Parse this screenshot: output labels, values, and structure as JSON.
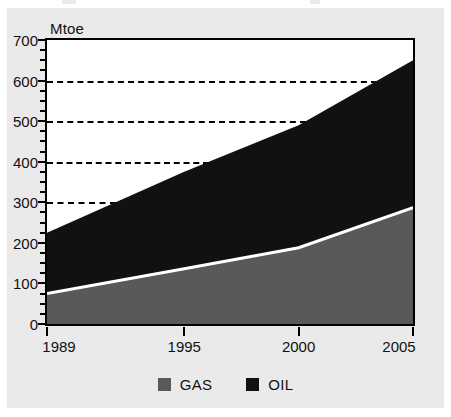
{
  "chart_data": {
    "type": "area",
    "title": "",
    "subtitle": "",
    "stacked": true,
    "xlabel": "",
    "ylabel": "Mtoe",
    "unit_label": "Mtoe",
    "x": [
      1989,
      1995,
      2000,
      2005
    ],
    "xlim": [
      1989,
      2005
    ],
    "ylim": [
      0,
      700
    ],
    "y_ticks": [
      0,
      100,
      200,
      300,
      400,
      500,
      600,
      700
    ],
    "y_tick_labels": [
      "0",
      "100",
      "200",
      "300",
      "400",
      "500",
      "600",
      "700"
    ],
    "y_minor_tick_step": 25,
    "x_ticks": [
      1989,
      1995,
      2000,
      2005
    ],
    "x_tick_labels": [
      "1989",
      "1995",
      "2000",
      "2005"
    ],
    "grid": "horizontal-dashed",
    "gridlines": [
      300,
      400,
      500,
      600
    ],
    "legend_position": "bottom-center",
    "series": [
      {
        "name": "GAS",
        "color": "#595959",
        "values": [
          75,
          136,
          188,
          287
        ]
      },
      {
        "name": "OIL",
        "color": "#111111",
        "values": [
          150,
          239,
          302,
          363
        ]
      }
    ],
    "stack_totals": [
      225,
      375,
      490,
      650
    ],
    "separator_line_color": "#ffffff"
  },
  "legend": {
    "items": [
      {
        "label": "GAS",
        "color": "#595959"
      },
      {
        "label": "OIL",
        "color": "#111111"
      }
    ]
  },
  "axes": {
    "unit_caption": "Mtoe",
    "y_labels": [
      "700",
      "600",
      "500",
      "400",
      "300",
      "200",
      "100",
      "0"
    ],
    "x_labels": [
      "1989",
      "1995",
      "2000",
      "2005"
    ]
  },
  "colors": {
    "figure_background": "#eaeaea",
    "plot_background": "#ffffff",
    "frame": "#000000",
    "gas": "#595959",
    "oil": "#111111",
    "text": "#111111"
  }
}
